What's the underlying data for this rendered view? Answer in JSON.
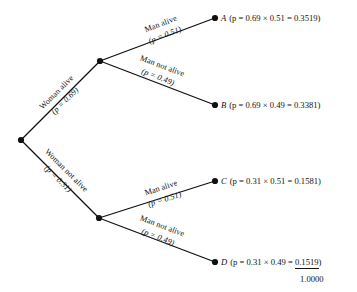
{
  "diagram": {
    "type": "probability-tree",
    "title": "",
    "root": {
      "label": "",
      "x": 21,
      "y": 140
    },
    "nodes": [
      {
        "id": "root",
        "x": 21,
        "y": 140
      },
      {
        "id": "woman-alive",
        "x": 100,
        "y": 61
      },
      {
        "id": "woman-not-alive",
        "x": 99,
        "y": 218
      },
      {
        "id": "A",
        "x": 215,
        "y": 18
      },
      {
        "id": "B",
        "x": 215,
        "y": 105
      },
      {
        "id": "C",
        "x": 215,
        "y": 181
      },
      {
        "id": "D",
        "x": 215,
        "y": 262
      }
    ],
    "branches": [
      {
        "id": "woman-alive",
        "name": "Woman alive",
        "prob_text": "(p = 0.69)",
        "prob": 0.69,
        "from": "root",
        "to": "woman-alive",
        "angle": -45
      },
      {
        "id": "woman-not-alive",
        "name": "Woman not alive",
        "prob_text": "(p = 0.31)",
        "prob": 0.31,
        "from": "root",
        "to": "woman-not-alive",
        "angle": 45
      },
      {
        "id": "man-alive-upper",
        "name": "Man alive",
        "prob_text": "(p = 0.51)",
        "prob": 0.51,
        "from": "woman-alive",
        "to": "A",
        "angle": -21
      },
      {
        "id": "man-not-alive-upper",
        "name": "Man not alive",
        "prob_text": "(p = 0.49)",
        "prob": 0.49,
        "from": "woman-alive",
        "to": "B",
        "angle": 21
      },
      {
        "id": "man-alive-lower",
        "name": "Man alive",
        "prob_text": "(p = 0.51)",
        "prob": 0.51,
        "from": "woman-not-alive",
        "to": "C",
        "angle": -18
      },
      {
        "id": "man-not-alive-lower",
        "name": "Man not alive",
        "prob_text": "(p = 0.49)",
        "prob": 0.49,
        "from": "woman-not-alive",
        "to": "D",
        "angle": 21
      }
    ],
    "outcomes": [
      {
        "letter": "A",
        "expr": "(p = 0.69 × 0.51 = 0.3519)",
        "factors": [
          0.69,
          0.51
        ],
        "value": 0.3519,
        "underlined": false
      },
      {
        "letter": "B",
        "expr": "(p = 0.69 × 0.49 = 0.3381)",
        "factors": [
          0.69,
          0.49
        ],
        "value": 0.3381,
        "underlined": false
      },
      {
        "letter": "C",
        "expr": "(p = 0.31 × 0.51 = 0.1581)",
        "factors": [
          0.31,
          0.51
        ],
        "value": 0.1581,
        "underlined": false
      },
      {
        "letter": "D",
        "expr": "(p = 0.31 × 0.49 = 0.1519)",
        "factors": [
          0.31,
          0.49
        ],
        "value": 0.1519,
        "underlined": true
      }
    ],
    "outcome_d_parts": {
      "prefix": "(p = 0.31 × 0.49 = ",
      "underlined_value": "0.1519",
      "suffix": ")"
    },
    "total": "1.0000",
    "colors": {
      "line": "#111111",
      "node": "#111111",
      "text": "#111111",
      "background": "#ffffff"
    }
  }
}
